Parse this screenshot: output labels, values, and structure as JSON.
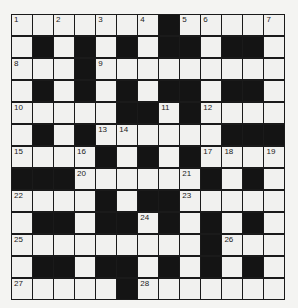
{
  "puzzle": {
    "rows": 13,
    "cols": 13,
    "grid": [
      "WWWWWWWBWWWWW",
      "WBWBWBWBBWBBW",
      "WWWBWWWWWWWWW",
      "WBWBWBWBBWBBW",
      "WWWWWBBWBWWWW",
      "WBWBWWWWWWBBB",
      "WWWWBWBWBWWWW",
      "BBBWWWWWWBWBW",
      "WWWWBWBBWWWWW",
      "WBBWBBWBWBWBW",
      "WWWWWWWWWBWWW",
      "WBBWBBWBWBWBW",
      "WWWWWBWWWWWWW"
    ],
    "numbers": [
      {
        "r": 0,
        "c": 0,
        "n": "1"
      },
      {
        "r": 0,
        "c": 2,
        "n": "2"
      },
      {
        "r": 0,
        "c": 4,
        "n": "3"
      },
      {
        "r": 0,
        "c": 6,
        "n": "4"
      },
      {
        "r": 0,
        "c": 8,
        "n": "5"
      },
      {
        "r": 0,
        "c": 9,
        "n": "6"
      },
      {
        "r": 0,
        "c": 12,
        "n": "7"
      },
      {
        "r": 2,
        "c": 0,
        "n": "8"
      },
      {
        "r": 2,
        "c": 4,
        "n": "9"
      },
      {
        "r": 4,
        "c": 0,
        "n": "10"
      },
      {
        "r": 4,
        "c": 7,
        "n": "11"
      },
      {
        "r": 4,
        "c": 9,
        "n": "12"
      },
      {
        "r": 5,
        "c": 4,
        "n": "13"
      },
      {
        "r": 5,
        "c": 5,
        "n": "14"
      },
      {
        "r": 6,
        "c": 0,
        "n": "15"
      },
      {
        "r": 6,
        "c": 3,
        "n": "16"
      },
      {
        "r": 6,
        "c": 9,
        "n": "17"
      },
      {
        "r": 6,
        "c": 10,
        "n": "18"
      },
      {
        "r": 6,
        "c": 12,
        "n": "19"
      },
      {
        "r": 7,
        "c": 3,
        "n": "20"
      },
      {
        "r": 7,
        "c": 8,
        "n": "21"
      },
      {
        "r": 8,
        "c": 0,
        "n": "22"
      },
      {
        "r": 8,
        "c": 8,
        "n": "23"
      },
      {
        "r": 9,
        "c": 6,
        "n": "24"
      },
      {
        "r": 10,
        "c": 0,
        "n": "25"
      },
      {
        "r": 10,
        "c": 10,
        "n": "26"
      },
      {
        "r": 12,
        "c": 0,
        "n": "27"
      },
      {
        "r": 12,
        "c": 6,
        "n": "28"
      }
    ]
  }
}
